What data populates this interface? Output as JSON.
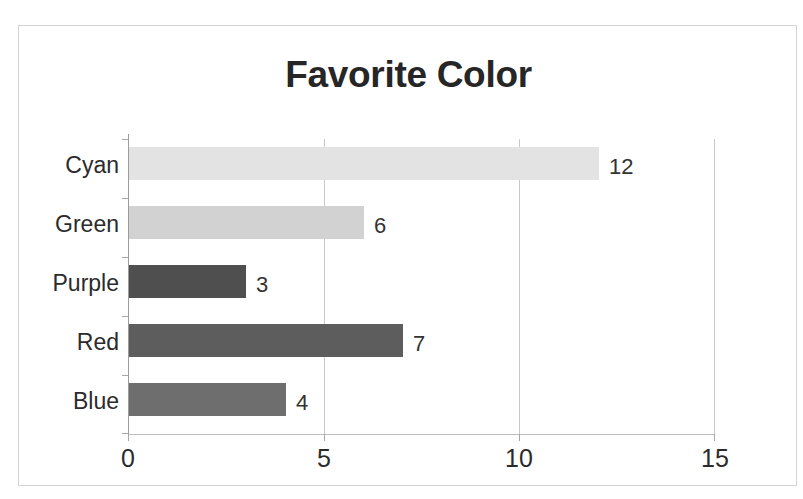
{
  "chart_data": {
    "type": "bar",
    "orientation": "horizontal",
    "title": "Favorite Color",
    "xlabel": "",
    "ylabel": "",
    "categories": [
      "Cyan",
      "Green",
      "Purple",
      "Red",
      "Blue"
    ],
    "values": [
      12,
      6,
      3,
      7,
      4
    ],
    "data_labels": [
      "12",
      "6",
      "3",
      "7",
      "4"
    ],
    "bar_colors": [
      "#e3e3e3",
      "#d2d2d2",
      "#4f4f4f",
      "#5d5d5d",
      "#6e6e6e"
    ],
    "xlim": [
      0,
      15
    ],
    "xticks": [
      0,
      5,
      10,
      15
    ],
    "xtick_labels": [
      "0",
      "5",
      "10",
      "15"
    ],
    "grid": true,
    "grid_axis": "x",
    "legend": false,
    "legend_position": "none",
    "title_color": "#262626",
    "axis_color": "#9c9c9c",
    "gridline_color": "#c9c9c9",
    "label_color": "#2b2b2b",
    "plot_background": "#ffffff",
    "border_color": "#d4d4d4"
  }
}
